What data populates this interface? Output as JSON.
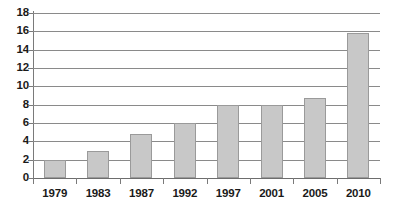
{
  "chart_data": {
    "type": "bar",
    "title": "",
    "subtitle": "",
    "xlabel": "",
    "ylabel": "",
    "categories": [
      "1979",
      "1983",
      "1987",
      "1992",
      "1997",
      "2001",
      "2005",
      "2010"
    ],
    "values": [
      2,
      2.9,
      4.8,
      6,
      8,
      8,
      8.7,
      15.8
    ],
    "series": [
      {
        "name": "",
        "values": [
          2,
          2.9,
          4.8,
          6,
          8,
          8,
          8.7,
          15.8
        ]
      }
    ],
    "ylim": [
      0,
      18
    ],
    "ytick_step": 2,
    "ytick_labels": [
      "0",
      "2",
      "4",
      "6",
      "8",
      "10",
      "12",
      "14",
      "16",
      "18"
    ],
    "ytick_values": [
      0,
      2,
      4,
      6,
      8,
      10,
      12,
      14,
      16,
      18
    ],
    "grid": true,
    "grid_axis": "y",
    "legend": false,
    "legend_position": "none",
    "annotations": [],
    "colors": {
      "bar_fill": "#c8c8c8",
      "bar_border": "#9a9a9a",
      "gridline": "#8a8a8a",
      "axis_line": "#6d6d6d",
      "tick_mark": "#7a7a7a",
      "label_text": "#1a1a1a",
      "background": "#ffffff"
    }
  }
}
